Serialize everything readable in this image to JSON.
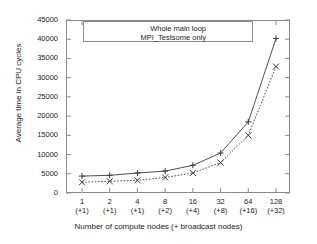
{
  "chart_data": {
    "type": "line",
    "title": "",
    "xlabel": "Number of compute nodes (+ broadcast nodes)",
    "ylabel": "Average time in CPU cycles",
    "categories": [
      "1",
      "2",
      "4",
      "8",
      "16",
      "32",
      "64",
      "128"
    ],
    "category_sublabels": [
      "(+1)",
      "(+1)",
      "(+1)",
      "(+2)",
      "(+4)",
      "(+8)",
      "(+16)",
      "(+32)"
    ],
    "ylim": [
      0,
      45000
    ],
    "yticks": [
      0,
      5000,
      10000,
      15000,
      20000,
      25000,
      30000,
      35000,
      40000,
      45000
    ],
    "ytick_labels": [
      "0",
      "5000",
      "10000",
      "15000",
      "20000",
      "25000",
      "30000",
      "35000",
      "40000",
      "45000"
    ],
    "grid": false,
    "legend_position": "top-center",
    "series": [
      {
        "name": "Whole main loop",
        "line_style": "solid",
        "marker": "plus",
        "color": "#3a3a3a",
        "values": [
          4400,
          4600,
          5200,
          5700,
          7200,
          10400,
          18500,
          40200
        ]
      },
      {
        "name": "MPI_Testsome only",
        "line_style": "dotted",
        "marker": "cross",
        "color": "#3a3a3a",
        "values": [
          2800,
          3050,
          3300,
          4050,
          5200,
          7900,
          15000,
          32900
        ]
      }
    ]
  },
  "colors": {
    "axis": "#8a8a8a",
    "text": "#1a1a1a",
    "background": "#ffffff"
  }
}
